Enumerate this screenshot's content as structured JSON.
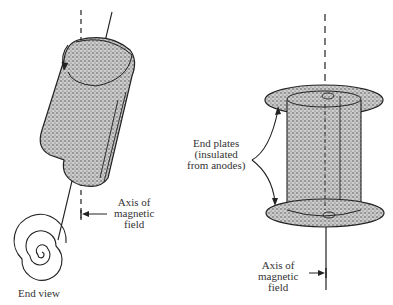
{
  "diagram": {
    "left_figure": {
      "axis_label": [
        "Axis of",
        "magnetic",
        "field"
      ],
      "end_view_label": "End view"
    },
    "right_figure": {
      "end_plates_label": [
        "End plates",
        "(insulated",
        "from anodes)"
      ],
      "axis_label": [
        "Axis of",
        "magnetic",
        "field"
      ]
    },
    "colors": {
      "ink": "#222222",
      "stipple": "#9a9a9a",
      "background": "#ffffff"
    }
  }
}
